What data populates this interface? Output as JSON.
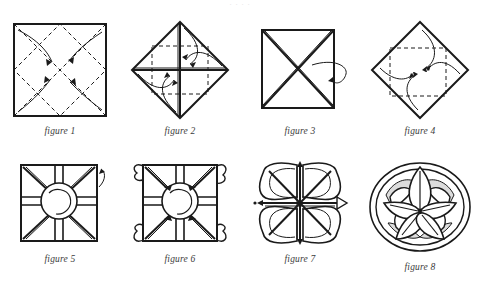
{
  "page": {
    "top_fragment": "    ·   · ·    · ",
    "background_color": "#ffffff",
    "ink_color": "#1a1a1a",
    "caption_color": "#3b3b3b"
  },
  "diagram": {
    "type": "origami-instruction-sequence",
    "step_count": 8,
    "rows": 2,
    "columns": 4,
    "steps": [
      {
        "id": 1,
        "caption": "figure 1",
        "shape": "square",
        "description": "Square sheet with dashed diagonal crease lines forming an inscribed diamond; four curved arrows point from the outer corners inward to the center.",
        "crease_style": "dashed",
        "arrow_count": 4,
        "arrow_direction": "corners-to-center"
      },
      {
        "id": 2,
        "caption": "figure 2",
        "shape": "diamond",
        "description": "Diamond (square rotated 45°) with solid vertical and horizontal center lines, a dashed inner square, and four curved arrows folding the points to the center.",
        "crease_style": "dashed",
        "arrow_count": 4,
        "arrow_direction": "points-to-center"
      },
      {
        "id": 3,
        "caption": "figure 3",
        "shape": "square",
        "description": "Closed square with solid X diagonals; a loop arrow on the right edge indicates turning the model over.",
        "crease_style": "solid",
        "arrow_count": 1,
        "arrow_direction": "turn-over"
      },
      {
        "id": 4,
        "caption": "figure 4",
        "shape": "diamond",
        "description": "Diamond with a dashed inner square; four curved arrows again fold the points into the center.",
        "crease_style": "dashed",
        "arrow_count": 4,
        "arrow_direction": "points-to-center"
      },
      {
        "id": 5,
        "caption": "figure 5",
        "shape": "square-with-circle",
        "description": "Square of four flaps with diagonal spokes and a circular swirl at the center; a small arrow at the upper right marks the first flap to pull.",
        "crease_style": "solid",
        "arrow_count": 1,
        "arrow_direction": "pull-flap"
      },
      {
        "id": 6,
        "caption": "figure 6",
        "shape": "square-with-circle",
        "description": "Same square but each of the four corners has a looping arrow pulling the hidden flap out to form a petal.",
        "crease_style": "solid",
        "arrow_count": 4,
        "arrow_direction": "pull-petals-outward"
      },
      {
        "id": 7,
        "caption": "figure 7",
        "shape": "four-petal-flower",
        "description": "Four rounded petals opened out around a star of spokes radiating from the center; small arrows show the remaining layers being drawn out.",
        "crease_style": "solid",
        "arrow_count": 4,
        "arrow_direction": "open-outward"
      },
      {
        "id": 8,
        "caption": "figure 8",
        "shape": "lotus-flower",
        "description": "Finished lotus: a round flower of five large rounded petals with shaded under-petals inside a circular outer rim.",
        "crease_style": "solid",
        "arrow_count": 0,
        "arrow_direction": "none"
      }
    ]
  }
}
